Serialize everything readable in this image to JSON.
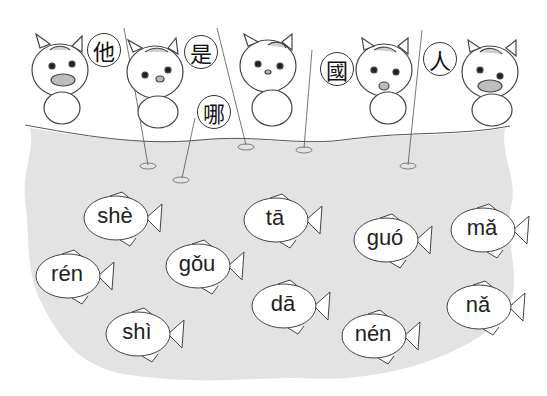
{
  "scene": {
    "description": "Cartoon tiger cats fishing with character signs; fish labeled with pinyin",
    "water_color": "#e3e3e3",
    "line_color": "#333333"
  },
  "signs": [
    {
      "char": "他",
      "x": 87,
      "y": 33
    },
    {
      "char": "是",
      "x": 184,
      "y": 35
    },
    {
      "char": "哪",
      "x": 197,
      "y": 95
    },
    {
      "char": "國",
      "x": 320,
      "y": 52
    },
    {
      "char": "人",
      "x": 423,
      "y": 42
    }
  ],
  "fish": [
    {
      "label": "shè",
      "x": 80,
      "y": 188
    },
    {
      "label": "rén",
      "x": 32,
      "y": 246
    },
    {
      "label": "shì",
      "x": 102,
      "y": 304
    },
    {
      "label": "gǒu",
      "x": 162,
      "y": 236
    },
    {
      "label": "tā",
      "x": 240,
      "y": 190
    },
    {
      "label": "dā",
      "x": 248,
      "y": 276
    },
    {
      "label": "guó",
      "x": 350,
      "y": 210
    },
    {
      "label": "nén",
      "x": 338,
      "y": 306
    },
    {
      "label": "mǎ",
      "x": 447,
      "y": 200
    },
    {
      "label": "nǎ",
      "x": 443,
      "y": 277
    }
  ]
}
